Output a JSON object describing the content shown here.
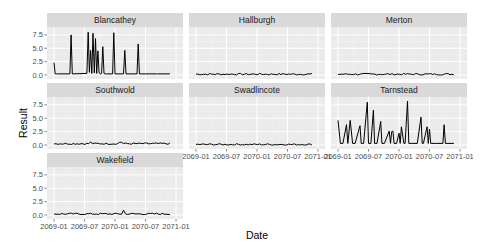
{
  "chart_data": {
    "type": "line",
    "title": "",
    "xlabel": "Date",
    "ylabel": "Result",
    "ylim": [
      0,
      8.6
    ],
    "yticks": [
      0.0,
      2.5,
      5.0,
      7.5
    ],
    "ytick_labels": [
      "0.0",
      "2.5",
      "5.0",
      "7.5"
    ],
    "xticks": [
      "2069-01",
      "2069-07",
      "2070-01",
      "2070-07",
      "2071-01"
    ],
    "grid": true,
    "legend": null,
    "facets": [
      {
        "name": "Blancathey",
        "row": 0,
        "col": 0,
        "x": [
          0,
          0.01,
          0.02,
          0.13,
          0.14,
          0.15,
          0.27,
          0.28,
          0.29,
          0.3,
          0.31,
          0.32,
          0.33,
          0.34,
          0.35,
          0.36,
          0.37,
          0.38,
          0.39,
          0.4,
          0.41,
          0.42,
          0.43,
          0.48,
          0.49,
          0.5,
          0.57,
          0.58,
          0.59,
          0.68,
          0.69,
          0.7,
          0.84,
          0.85,
          0.86,
          0.95
        ],
        "y": [
          2.3,
          0.2,
          0.2,
          0.2,
          7.5,
          0.2,
          0.3,
          8.0,
          0.5,
          4.6,
          0.3,
          7.8,
          0.4,
          6.8,
          0.3,
          4.5,
          0.4,
          0.2,
          0.3,
          5.3,
          0.3,
          0.2,
          0.2,
          0.2,
          7.9,
          0.2,
          0.2,
          4.6,
          0.2,
          0.2,
          5.8,
          0.2,
          0.2,
          0.2,
          0.2,
          0.2
        ]
      },
      {
        "name": "Hallburgh",
        "row": 0,
        "col": 1,
        "flat": 0.15
      },
      {
        "name": "Merton",
        "row": 0,
        "col": 2,
        "flat": 0.15
      },
      {
        "name": "Southwold",
        "row": 1,
        "col": 0,
        "flat": 0.25,
        "bumps": [
          [
            0.3,
            0.6
          ],
          [
            0.55,
            0.5
          ]
        ]
      },
      {
        "name": "Swadlincote",
        "row": 1,
        "col": 1,
        "flat": 0.1
      },
      {
        "name": "Tarnstead",
        "row": 1,
        "col": 2,
        "x": [
          0,
          0.02,
          0.04,
          0.07,
          0.08,
          0.1,
          0.12,
          0.14,
          0.18,
          0.19,
          0.21,
          0.24,
          0.25,
          0.27,
          0.29,
          0.3,
          0.32,
          0.35,
          0.36,
          0.38,
          0.42,
          0.43,
          0.44,
          0.45,
          0.46,
          0.48,
          0.5,
          0.51,
          0.52,
          0.54,
          0.55,
          0.57,
          0.58,
          0.6,
          0.65,
          0.68,
          0.69,
          0.7,
          0.73,
          0.74,
          0.75,
          0.76,
          0.77,
          0.8,
          0.86,
          0.87,
          0.88,
          0.95
        ],
        "y": [
          4.6,
          0.3,
          0.3,
          3.8,
          0.3,
          4.6,
          0.3,
          0.3,
          3.6,
          0.3,
          0.3,
          8.0,
          0.3,
          0.3,
          6.5,
          0.3,
          0.3,
          4.4,
          0.3,
          0.3,
          2.6,
          0.3,
          2.5,
          2.6,
          0.3,
          0.3,
          2.2,
          0.3,
          3.4,
          0.3,
          0.3,
          8.2,
          0.3,
          0.3,
          0.3,
          5.2,
          0.3,
          0.3,
          3.4,
          0.3,
          3.0,
          0.3,
          0.3,
          0.3,
          0.3,
          3.8,
          0.3,
          0.3
        ]
      },
      {
        "name": "Wakefield",
        "row": 2,
        "col": 0,
        "flat": 0.2,
        "bumps": [
          [
            0.57,
            0.9
          ]
        ]
      }
    ]
  }
}
